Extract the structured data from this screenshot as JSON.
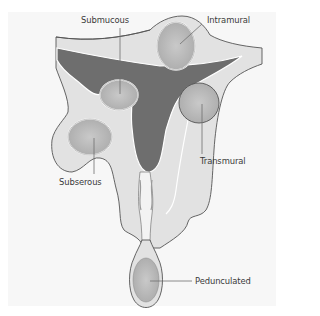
{
  "diagram": {
    "colors": {
      "background": "#f7f7f7",
      "uterine_wall": "#e0e0e0",
      "cavity": "#6e6e6e",
      "fibroid": "#b4b4b4",
      "outline": "#555555",
      "leader_line": "#707070",
      "label_text": "#3a3a3a"
    },
    "labels": {
      "submucous": "Submucous",
      "intramural": "Intramural",
      "transmural": "Transmural",
      "subserous": "Subserous",
      "pedunculated": "Pedunculated"
    }
  }
}
